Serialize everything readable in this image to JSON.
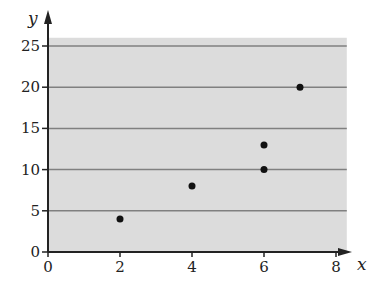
{
  "chart_data": {
    "type": "scatter",
    "title": "",
    "xlabel": "x",
    "ylabel": "y",
    "xlim": [
      0,
      8
    ],
    "ylim": [
      0,
      26
    ],
    "xticks": [
      0,
      2,
      4,
      6,
      8
    ],
    "yticks": [
      0,
      5,
      10,
      15,
      20,
      25
    ],
    "grid": "horizontal",
    "background": "#dcdcdc",
    "gridline_color": "#808080",
    "point_color": "#111111",
    "points": [
      {
        "x": 2,
        "y": 4
      },
      {
        "x": 4,
        "y": 8
      },
      {
        "x": 6,
        "y": 10
      },
      {
        "x": 6,
        "y": 13
      },
      {
        "x": 7,
        "y": 20
      }
    ]
  }
}
